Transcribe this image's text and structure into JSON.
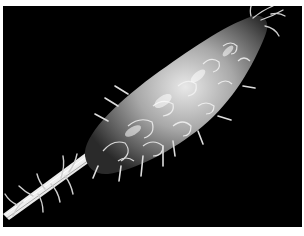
{
  "image": {
    "subject": "scanning electron micrograph of a spiny elongated specimen on a stalk",
    "background_color": "#000000",
    "border_color": "#ffffff",
    "palette": [
      "#000000",
      "#ffffff",
      "#cfcfcf",
      "#8a8a8a",
      "#4a4a4a"
    ]
  }
}
